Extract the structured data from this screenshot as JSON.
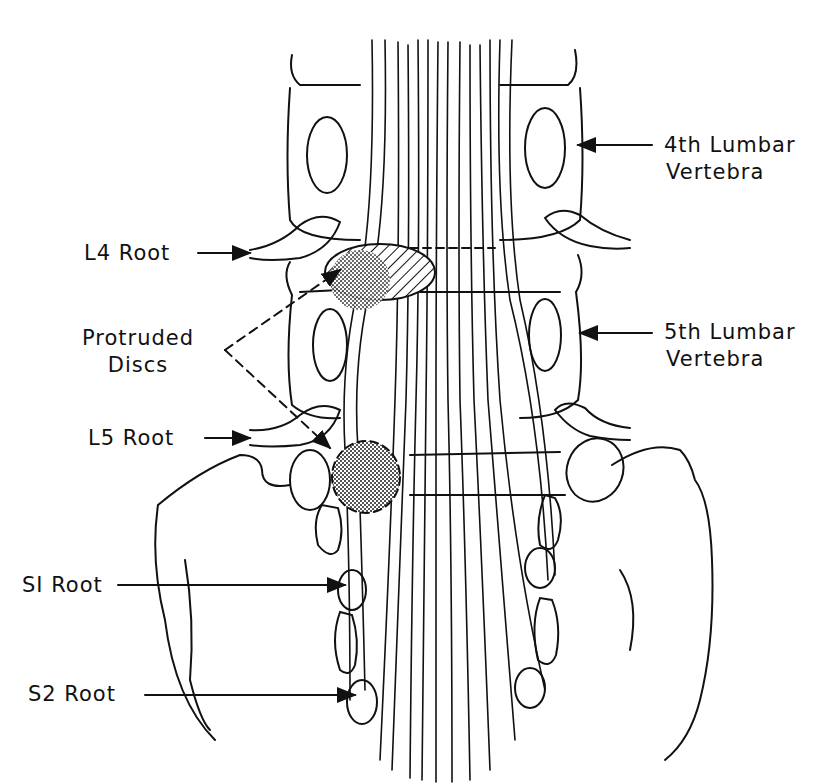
{
  "figure": {
    "type": "anatomical line drawing",
    "colors": {
      "line": "#111111",
      "background": "#ffffff",
      "stipple": "#888888"
    }
  },
  "labels": {
    "l4_root": "L4 Root",
    "protruded_discs_line1": "Protruded",
    "protruded_discs_line2": "Discs",
    "l5_root": "L5 Root",
    "s1_root": "SI Root",
    "s2_root": "S2 Root",
    "lumbar4_line1": "4th  Lumbar",
    "lumbar4_line2": "Vertebra",
    "lumbar5_line1": "5th  Lumbar",
    "lumbar5_line2": "Vertebra"
  }
}
